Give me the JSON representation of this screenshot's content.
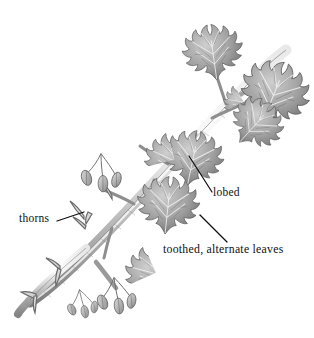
{
  "figure": {
    "kind": "botanical-illustration",
    "background_color": "#ffffff",
    "ink_color": "#111111",
    "drawing_tone_dark": "#555555",
    "drawing_tone_mid": "#8d8d8d",
    "drawing_tone_light": "#c9c9c9"
  },
  "annotations": [
    {
      "id": "thorns",
      "label": "thorns",
      "text_x": 19,
      "text_y": 212,
      "leader": {
        "x1": 57,
        "y1": 221,
        "x2": 84,
        "y2": 212
      }
    },
    {
      "id": "lobed",
      "label": "lobed",
      "text_x": 213,
      "text_y": 186,
      "leader": {
        "x1": 189,
        "y1": 156,
        "x2": 212,
        "y2": 192
      }
    },
    {
      "id": "toothed",
      "label": "toothed, alternate leaves",
      "text_x": 163,
      "text_y": 243,
      "leader": {
        "x1": 200,
        "y1": 215,
        "x2": 227,
        "y2": 242
      }
    }
  ]
}
